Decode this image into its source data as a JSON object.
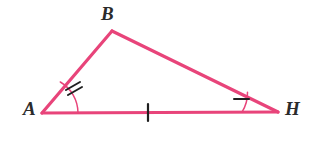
{
  "figure": {
    "kind": "geometry-diagram",
    "shape": "triangle",
    "name": "Triangle ABH",
    "background_color": "#ffffff",
    "stroke_color": "#e8447a",
    "mark_color": "#1f1f1f",
    "label_color": "#2b2b2b",
    "stroke_width": 3.2,
    "canvas": {
      "width": 316,
      "height": 152
    }
  },
  "vertices": [
    {
      "id": "A",
      "label": "A",
      "x": 42,
      "y": 113,
      "label_x": 23,
      "label_y": 99
    },
    {
      "id": "B",
      "label": "B",
      "x": 112,
      "y": 31,
      "label_x": 101,
      "label_y": 4
    },
    {
      "id": "H",
      "label": "H",
      "x": 278,
      "y": 112,
      "label_x": 285,
      "label_y": 99
    }
  ],
  "sides": [
    {
      "id": "AB",
      "from": "A",
      "to": "B",
      "tick_count": 0
    },
    {
      "id": "BH",
      "from": "B",
      "to": "H",
      "tick_count": 0
    },
    {
      "id": "AH",
      "from": "A",
      "to": "H",
      "tick_count": 1,
      "tick_x": 148,
      "tick_y": 112
    }
  ],
  "angle_marks": [
    {
      "at": "A",
      "arc_radius": 36,
      "tick_count": 2,
      "meaning": "congruent-angle-double-tick"
    },
    {
      "at": "H",
      "arc_radius": 36,
      "tick_count": 1,
      "meaning": "congruent-angle-single-tick"
    }
  ],
  "chart_data": {
    "type": "diagram",
    "categories": [
      "A",
      "B",
      "H"
    ],
    "points": [
      {
        "label": "A",
        "x": 42,
        "y": 113
      },
      {
        "label": "B",
        "x": 112,
        "y": 31
      },
      {
        "label": "H",
        "x": 278,
        "y": 112
      }
    ],
    "edges": [
      {
        "from": "A",
        "to": "B",
        "ticks": 0
      },
      {
        "from": "B",
        "to": "H",
        "ticks": 0
      },
      {
        "from": "A",
        "to": "H",
        "ticks": 1
      }
    ],
    "angle_ticks": {
      "A": 2,
      "B": 0,
      "H": 1
    },
    "xlabel": "",
    "ylabel": "",
    "legend": []
  }
}
